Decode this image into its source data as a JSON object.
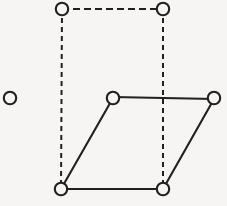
{
  "figure": {
    "background_color": "#f6f5f3",
    "stroke_color": "#231f20",
    "canvas": {
      "width": 227,
      "height": 206
    },
    "node_radius": 6.2,
    "dash_vertical_pattern": "5 4",
    "dash_horizontal_pattern": "7 4",
    "nodes": [
      {
        "id": "isolated",
        "label": "isolated-node",
        "cx": 10,
        "cy": 98,
        "style": "open"
      },
      {
        "id": "top-left",
        "label": "rect-top-left-node",
        "cx": 62,
        "cy": 9,
        "style": "open"
      },
      {
        "id": "top-right",
        "label": "rect-top-right-node",
        "cx": 163,
        "cy": 9,
        "style": "open"
      },
      {
        "id": "mid-left",
        "label": "para-top-left-node",
        "cx": 113,
        "cy": 98,
        "style": "open"
      },
      {
        "id": "mid-right",
        "label": "para-top-right-node",
        "cx": 214,
        "cy": 98,
        "style": "open"
      },
      {
        "id": "bottom-left",
        "label": "shared-bottom-left-node",
        "cx": 61,
        "cy": 189,
        "style": "open"
      },
      {
        "id": "bottom-right",
        "label": "shared-bottom-right-node",
        "cx": 163,
        "cy": 189,
        "style": "open"
      }
    ],
    "edges": [
      {
        "id": "rect-top",
        "label": "rectangle-top-edge",
        "from": "top-left",
        "to": "top-right",
        "style": "dashed",
        "x1": 62,
        "y1": 9,
        "x2": 163,
        "y2": 9,
        "dash": "7 4"
      },
      {
        "id": "rect-left",
        "label": "rectangle-left-edge",
        "from": "top-left",
        "to": "bottom-left",
        "style": "dashed",
        "x1": 62,
        "y1": 9,
        "x2": 61,
        "y2": 189,
        "dash": "5 4"
      },
      {
        "id": "rect-right",
        "label": "rectangle-right-edge",
        "from": "top-right",
        "to": "bottom-right",
        "style": "dashed",
        "x1": 163,
        "y1": 9,
        "x2": 163,
        "y2": 189,
        "dash": "5 4"
      },
      {
        "id": "para-top",
        "label": "parallelogram-top-edge",
        "from": "mid-left",
        "to": "mid-right",
        "style": "solid",
        "x1": 113,
        "y1": 97,
        "x2": 214,
        "y2": 99
      },
      {
        "id": "para-left",
        "label": "parallelogram-left-edge",
        "from": "mid-left",
        "to": "bottom-left",
        "style": "solid",
        "x1": 113,
        "y1": 98,
        "x2": 61,
        "y2": 189
      },
      {
        "id": "para-right",
        "label": "parallelogram-right-edge",
        "from": "mid-right",
        "to": "bottom-right",
        "style": "solid",
        "x1": 214,
        "y1": 99,
        "x2": 163,
        "y2": 189
      },
      {
        "id": "para-bottom",
        "label": "parallelogram-bottom-edge",
        "from": "bottom-left",
        "to": "bottom-right",
        "style": "solid",
        "x1": 61,
        "y1": 189,
        "x2": 163,
        "y2": 189
      }
    ]
  }
}
